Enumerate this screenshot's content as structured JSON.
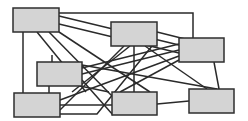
{
  "diagram": {
    "type": "network-graph",
    "colors": {
      "box_fill": "#d4d4d4",
      "box_stroke": "#2e2e2e",
      "edge": "#2a2a2a",
      "background": "#ffffff"
    },
    "nodes": [
      {
        "id": "A",
        "x": 13,
        "y": 8,
        "w": 46,
        "h": 24
      },
      {
        "id": "B",
        "x": 111,
        "y": 22,
        "w": 46,
        "h": 24
      },
      {
        "id": "C",
        "x": 179,
        "y": 38,
        "w": 45,
        "h": 24
      },
      {
        "id": "D",
        "x": 37,
        "y": 62,
        "w": 45,
        "h": 24
      },
      {
        "id": "E",
        "x": 14,
        "y": 93,
        "w": 46,
        "h": 24
      },
      {
        "id": "F",
        "x": 112,
        "y": 92,
        "w": 45,
        "h": 23
      },
      {
        "id": "G",
        "x": 189,
        "y": 89,
        "w": 45,
        "h": 24
      }
    ],
    "edges": [
      {
        "points": [
          [
            59,
            13
          ],
          [
            193,
            13
          ],
          [
            193,
            38
          ]
        ]
      },
      {
        "points": [
          [
            59,
            16
          ],
          [
            179,
            45
          ]
        ]
      },
      {
        "points": [
          [
            59,
            24
          ],
          [
            179,
            53
          ]
        ]
      },
      {
        "points": [
          [
            23,
            32
          ],
          [
            23,
            93
          ]
        ]
      },
      {
        "points": [
          [
            37,
            32
          ],
          [
            86,
            92
          ]
        ]
      },
      {
        "points": [
          [
            49,
            32
          ],
          [
            112,
            96
          ]
        ]
      },
      {
        "points": [
          [
            59,
            32
          ],
          [
            150,
            92
          ]
        ]
      },
      {
        "points": [
          [
            124,
            46
          ],
          [
            60,
            110
          ]
        ]
      },
      {
        "points": [
          [
            130,
            46
          ],
          [
            72,
            92
          ]
        ]
      },
      {
        "points": [
          [
            134,
            46
          ],
          [
            134,
            92
          ]
        ]
      },
      {
        "points": [
          [
            145,
            46
          ],
          [
            207,
            89
          ]
        ]
      },
      {
        "points": [
          [
            157,
            32
          ],
          [
            189,
            40
          ]
        ]
      },
      {
        "points": [
          [
            0,
            0
          ],
          [
            0,
            0
          ]
        ]
      },
      {
        "points": [
          [
            82,
            68
          ],
          [
            179,
            44
          ]
        ]
      },
      {
        "points": [
          [
            82,
            74
          ],
          [
            179,
            50
          ]
        ]
      },
      {
        "points": [
          [
            60,
            100
          ],
          [
            179,
            56
          ]
        ]
      },
      {
        "points": [
          [
            82,
            80
          ],
          [
            113,
            115
          ]
        ]
      },
      {
        "points": [
          [
            52,
            55
          ],
          [
            52,
            62
          ]
        ]
      },
      {
        "points": [
          [
            49,
            86
          ],
          [
            49,
            93
          ]
        ]
      },
      {
        "points": [
          [
            60,
            105
          ],
          [
            112,
            105
          ]
        ]
      },
      {
        "points": [
          [
            157,
            104
          ],
          [
            189,
            101
          ]
        ]
      },
      {
        "points": [
          [
            214,
            62
          ],
          [
            219,
            89
          ]
        ]
      },
      {
        "points": [
          [
            179,
            60
          ],
          [
            120,
            92
          ]
        ]
      },
      {
        "points": [
          [
            60,
            114
          ],
          [
            97,
            114
          ],
          [
            152,
            46
          ]
        ]
      },
      {
        "points": [
          [
            82,
            65
          ],
          [
            217,
            89
          ]
        ]
      },
      {
        "points": [
          [
            80,
            86
          ],
          [
            109,
            92
          ]
        ]
      }
    ]
  }
}
